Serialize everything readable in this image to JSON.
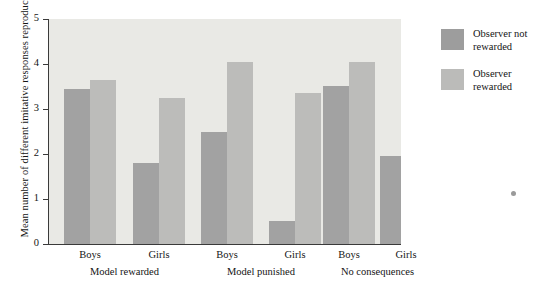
{
  "chart_data": {
    "type": "bar",
    "title": "",
    "xlabel": "",
    "ylabel": "Mean number of different imitative responses reproduced",
    "ylim": [
      0,
      5
    ],
    "yticks": [
      0,
      1,
      2,
      3,
      4,
      5
    ],
    "grid": false,
    "legend_position": "right",
    "categories": [
      "Boys",
      "Girls",
      "Boys",
      "Girls",
      "Boys",
      "Girls"
    ],
    "group_labels": [
      "Model rewarded",
      "Model punished",
      "No consequences"
    ],
    "series": [
      {
        "name": "Observer not rewarded",
        "color": "#a2a2a2",
        "values": [
          3.45,
          1.8,
          2.5,
          0.52,
          3.52,
          1.95
        ]
      },
      {
        "name": "Observer rewarded",
        "color": "#bcbcba",
        "values": [
          3.65,
          3.25,
          4.05,
          3.35,
          4.05,
          3.05
        ]
      }
    ]
  },
  "axis": {
    "y_title": "Mean number of different imitative responses reproduced",
    "y_tick_labels": [
      "0",
      "1",
      "2",
      "3",
      "4",
      "5"
    ]
  },
  "legend": {
    "items": [
      {
        "label_line1": "Observer not",
        "label_line2": "rewarded",
        "swatch": "dark-swatch"
      },
      {
        "label_line1": "Observer",
        "label_line2": "rewarded",
        "swatch": "light-swatch"
      }
    ]
  }
}
